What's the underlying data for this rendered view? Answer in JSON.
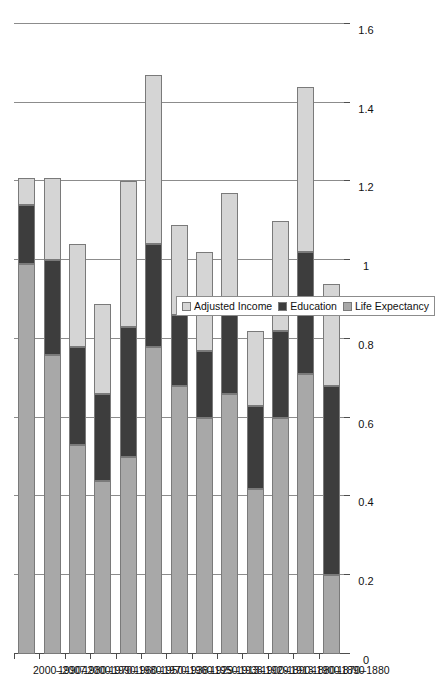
{
  "chart_data": {
    "type": "bar",
    "orientation": "horizontal",
    "stacked": true,
    "title": "",
    "xlabel": "",
    "ylabel": "",
    "grid": true,
    "legend_position": "bottom-right",
    "xlim": [
      0,
      1.6
    ],
    "x_ticks": [
      "0",
      "0.2",
      "0.4",
      "0.6",
      "0.8",
      "1",
      "1.2",
      "1.4",
      "1.6"
    ],
    "x_tick_values": [
      0,
      0.2,
      0.4,
      0.6,
      0.8,
      1,
      1.2,
      1.4,
      1.6
    ],
    "categories": [
      "1870–1880",
      "1880–1890",
      "1890–1900",
      "1900–1913",
      "1913–1929",
      "1929–1938",
      "1938–1950",
      "1950–1960",
      "1960–1970",
      "1970–1980",
      "1980–1990",
      "1990–2000",
      "2000–2007"
    ],
    "series": [
      {
        "name": "Life Expectancy",
        "color": "#a8a8a8",
        "values": [
          0.2,
          0.71,
          0.6,
          0.42,
          0.66,
          0.6,
          0.68,
          0.78,
          0.5,
          0.44,
          0.53,
          0.76,
          0.99
        ]
      },
      {
        "name": "Education",
        "color": "#3d3d3d",
        "values": [
          0.48,
          0.31,
          0.22,
          0.21,
          0.23,
          0.17,
          0.18,
          0.26,
          0.33,
          0.22,
          0.25,
          0.24,
          0.15
        ]
      },
      {
        "name": "Adjusted Income",
        "color": "#d5d5d5",
        "values": [
          0.26,
          0.42,
          0.28,
          0.19,
          0.28,
          0.25,
          0.23,
          0.43,
          0.37,
          0.23,
          0.26,
          0.21,
          0.07
        ]
      }
    ],
    "totals": [
      0.94,
      1.44,
      1.1,
      0.82,
      1.17,
      1.02,
      1.09,
      1.47,
      1.2,
      0.89,
      1.04,
      1.21,
      1.21
    ]
  },
  "legend": {
    "entries": [
      {
        "label": "Adjusted Income",
        "color": "#d5d5d5"
      },
      {
        "label": "Education",
        "color": "#3d3d3d"
      },
      {
        "label": "Life Expectancy",
        "color": "#a8a8a8"
      }
    ]
  },
  "colors": {
    "adjusted_income": "#d5d5d5",
    "education": "#3d3d3d",
    "life_expectancy": "#a8a8a8",
    "grid": "#8c8c8c",
    "axis": "#4d4d4d",
    "background": "#ffffff"
  }
}
